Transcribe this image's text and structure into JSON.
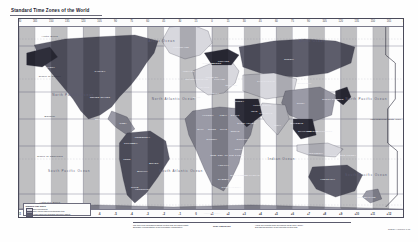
{
  "document": {
    "title": "Standard Time Zones of the World",
    "type": "world-time-zone-map",
    "projection": "Miller cylindrical"
  },
  "map": {
    "longitude_ticks": [
      "180",
      "165",
      "150",
      "135",
      "120",
      "105",
      "90",
      "75",
      "60",
      "45",
      "30",
      "15",
      "0",
      "15",
      "30",
      "45",
      "60",
      "75",
      "90",
      "105",
      "120",
      "135",
      "150",
      "165",
      "180"
    ],
    "offset_ticks": [
      "-11",
      "-10",
      "-9",
      "-8",
      "-7",
      "-6",
      "-5",
      "-4",
      "-3",
      "-2",
      "-1",
      "0",
      "+1",
      "+2",
      "+3",
      "+4",
      "+5",
      "+6",
      "+7",
      "+8",
      "+9",
      "+10",
      "+11",
      "+12",
      "-12"
    ],
    "latitude_lines": [
      "Arctic Circle",
      "Tropic of Cancer",
      "Equator",
      "Tropic of Capricorn",
      "Antarctic Circle"
    ],
    "ocean_labels": [
      {
        "name": "Arctic Ocean",
        "x": 37,
        "y": 11
      },
      {
        "name": "Arctic Ocean",
        "x": 76,
        "y": 11
      },
      {
        "name": "North Pacific Ocean",
        "x": 14,
        "y": 38
      },
      {
        "name": "North Atlantic Ocean",
        "x": 40,
        "y": 40
      },
      {
        "name": "Indian Ocean",
        "x": 68,
        "y": 70
      },
      {
        "name": "South Pacific Ocean",
        "x": 13,
        "y": 76
      },
      {
        "name": "South Atlantic Ocean",
        "x": 42,
        "y": 76
      },
      {
        "name": "North Pacific Ocean",
        "x": 90,
        "y": 40
      },
      {
        "name": "South Pacific Ocean",
        "x": 90,
        "y": 78
      }
    ],
    "region_labels": [
      {
        "name": "GREENLAND",
        "x": 42,
        "y": 14
      },
      {
        "name": "CANADA",
        "x": 21,
        "y": 26
      },
      {
        "name": "ALASKA",
        "x": 8,
        "y": 24
      },
      {
        "name": "UNITED STATES",
        "x": 21,
        "y": 39
      },
      {
        "name": "MEXICO",
        "x": 21,
        "y": 50
      },
      {
        "name": "BRAZIL",
        "x": 35,
        "y": 72
      },
      {
        "name": "ARGENTINA",
        "x": 32,
        "y": 85
      },
      {
        "name": "ICELAND",
        "x": 44,
        "y": 26
      },
      {
        "name": "NORWAY",
        "x": 49,
        "y": 22
      },
      {
        "name": "UNITED KINGDOM",
        "x": 46,
        "y": 30
      },
      {
        "name": "SPAIN",
        "x": 46,
        "y": 39
      },
      {
        "name": "FRANCE",
        "x": 48,
        "y": 34
      },
      {
        "name": "ALGERIA",
        "x": 49,
        "y": 48
      },
      {
        "name": "LIBYA",
        "x": 53,
        "y": 48
      },
      {
        "name": "EGYPT",
        "x": 56,
        "y": 48
      },
      {
        "name": "NIGERIA",
        "x": 50,
        "y": 60
      },
      {
        "name": "DEM. REP. OF THE CONGO",
        "x": 54,
        "y": 68
      },
      {
        "name": "ANGOLA",
        "x": 53,
        "y": 73
      },
      {
        "name": "SOUTH AFRICA",
        "x": 55,
        "y": 84
      },
      {
        "name": "MADAGASCAR",
        "x": 60,
        "y": 78
      },
      {
        "name": "SAUDI ARABIA",
        "x": 59,
        "y": 52
      },
      {
        "name": "RUSSIA",
        "x": 70,
        "y": 20
      },
      {
        "name": "KAZAKHSTAN",
        "x": 64,
        "y": 31
      },
      {
        "name": "CHINA",
        "x": 73,
        "y": 42
      },
      {
        "name": "MONGOLIA",
        "x": 74,
        "y": 32
      },
      {
        "name": "INDIA",
        "x": 67,
        "y": 53
      },
      {
        "name": "JAPAN",
        "x": 83,
        "y": 40
      },
      {
        "name": "INDONESIA",
        "x": 77,
        "y": 67
      },
      {
        "name": "AUSTRALIA",
        "x": 80,
        "y": 80
      },
      {
        "name": "NEW ZEALAND",
        "x": 90,
        "y": 89
      },
      {
        "name": "PAPUA NEW GUINEA",
        "x": 84,
        "y": 68
      },
      {
        "name": "PHILIPPINES",
        "x": 79,
        "y": 56
      },
      {
        "name": "IRAN",
        "x": 61,
        "y": 46
      },
      {
        "name": "TURKEY",
        "x": 57,
        "y": 41
      },
      {
        "name": "UKRAINE",
        "x": 55,
        "y": 33
      },
      {
        "name": "SWEDEN",
        "x": 51,
        "y": 22
      },
      {
        "name": "FINLAND",
        "x": 53,
        "y": 21
      },
      {
        "name": "POLAND",
        "x": 52,
        "y": 30
      },
      {
        "name": "GERMANY",
        "x": 50,
        "y": 29
      },
      {
        "name": "ITALY",
        "x": 51,
        "y": 37
      },
      {
        "name": "PERU",
        "x": 28,
        "y": 70
      },
      {
        "name": "CHILE",
        "x": 30,
        "y": 84
      },
      {
        "name": "COLOMBIA",
        "x": 29,
        "y": 62
      },
      {
        "name": "VENEZUELA",
        "x": 32,
        "y": 59
      },
      {
        "name": "BOLIVIA",
        "x": 32,
        "y": 76
      },
      {
        "name": "CUBA",
        "x": 27,
        "y": 52
      },
      {
        "name": "SUDAN",
        "x": 56,
        "y": 56
      },
      {
        "name": "ETHIOPIA",
        "x": 58,
        "y": 60
      },
      {
        "name": "KENYA",
        "x": 57,
        "y": 65
      },
      {
        "name": "MALI",
        "x": 47,
        "y": 55
      },
      {
        "name": "NIGER",
        "x": 50,
        "y": 55
      },
      {
        "name": "CHAD",
        "x": 53,
        "y": 55
      },
      {
        "name": "THAILAND",
        "x": 74,
        "y": 56
      },
      {
        "name": "VIETNAM",
        "x": 76,
        "y": 56
      },
      {
        "name": "MYANMAR",
        "x": 72,
        "y": 52
      },
      {
        "name": "PAKISTAN",
        "x": 64,
        "y": 47
      },
      {
        "name": "AFGHANISTAN",
        "x": 63,
        "y": 43
      },
      {
        "name": "SOUTH KOREA",
        "x": 81,
        "y": 40
      },
      {
        "name": "NAMIBIA",
        "x": 53,
        "y": 80
      },
      {
        "name": "MOZAMBIQUE",
        "x": 57,
        "y": 78
      },
      {
        "name": "ANTARCTICA",
        "x": 50,
        "y": 97
      }
    ],
    "date_line_label": "International Date Line",
    "antimeridian_note": "180"
  },
  "legend": {
    "title": "Standard Time Zones",
    "rows": [
      {
        "label": "Zone boundaries"
      },
      {
        "label": "Time zones observing standard time"
      },
      {
        "label": "Areas using non-standard half-hour offsets"
      }
    ]
  },
  "footer": {
    "left_caption_line1": "The time zone boundaries shown on this map are approximate.",
    "left_caption_line2": "Boundary representation is not necessarily authoritative.",
    "right_caption_line1": "Hours are counted from Greenwich Mean Time (GMT).",
    "right_caption_line2": "Daylight saving time is not reflected on this map.",
    "scale_note": "Scale 1:85,000,000",
    "date_code": "802839AI (R01000) 1-15"
  },
  "colors": {
    "frame": "#4a4a5a",
    "grid": "#b9b9c6",
    "grid_major": "#8b8b9c",
    "ocean": "#fdfdfd",
    "band_light": "#d8d8de",
    "band_mid": "#9a9aa6",
    "band_dark": "#5d5d6b",
    "band_darkest": "#2e2e3a",
    "text": "#2a2a38"
  }
}
